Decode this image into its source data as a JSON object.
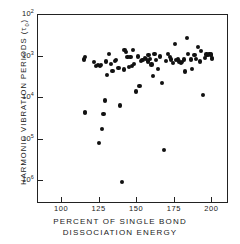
{
  "chart_data": {
    "type": "scatter",
    "title": "",
    "xlabel": "PERCENT OF SINGLE BOND DISSOCIATION ENERGY",
    "xlabel_line1": "PERCENT OF SINGLE BOND",
    "xlabel_line2": "DISSOCIATION ENERGY",
    "ylabel": "HARMONIC VIBRATION PERIODS (τ₀)",
    "ylabel_text": "HARMONIC VIBRATION PERIODS (",
    "ylabel_symbol": "τ",
    "ylabel_subscript": "0",
    "ylabel_close": ")",
    "xlim": [
      84,
      211
    ],
    "ylim_log_exponents": [
      2,
      6.55
    ],
    "yscale": "log-inverted",
    "y_axis_direction": "decreasing-downward",
    "grid": false,
    "legend": null,
    "marker": "filled-circle",
    "marker_color": "#111111",
    "frame_color": "#222222",
    "background": "#ffffff",
    "xticks": [
      {
        "value": 100,
        "label": "100"
      },
      {
        "value": 125,
        "label": "125"
      },
      {
        "value": 150,
        "label": "150"
      },
      {
        "value": 175,
        "label": "175"
      },
      {
        "value": 200,
        "label": "200"
      }
    ],
    "yticks": [
      {
        "exponent": 2,
        "mantissa": "10",
        "label": "10²"
      },
      {
        "exponent": 3,
        "mantissa": "10",
        "label": "10³"
      },
      {
        "exponent": 4,
        "mantissa": "10",
        "label": "10⁴"
      },
      {
        "exponent": 5,
        "mantissa": "10",
        "label": "10⁵"
      },
      {
        "exponent": 6,
        "mantissa": "10",
        "label": "10⁶"
      }
    ],
    "x": [
      114.5,
      115.5,
      115.0,
      115.2,
      121.5,
      122.5,
      124.0,
      125.0,
      126.0,
      124.5,
      126.5,
      127.5,
      128.5,
      129.0,
      130.0,
      131.0,
      132.5,
      133.5,
      135.0,
      136.0,
      137.5,
      138.5,
      140.0,
      141.0,
      141.5,
      142.5,
      143.5,
      144.5,
      145.5,
      146.5,
      147.0,
      148.0,
      149.0,
      150.5,
      151.5,
      152.5,
      153.5,
      155.0,
      156.0,
      157.0,
      157.5,
      158.5,
      159.5,
      160.5,
      161.5,
      162.5,
      164.0,
      165.0,
      166.5,
      168.0,
      169.0,
      170.5,
      171.5,
      172.5,
      173.5,
      175.0,
      176.0,
      177.0,
      178.0,
      179.0,
      180.0,
      181.0,
      182.0,
      183.0,
      184.0,
      185.5,
      186.5,
      188.0,
      189.0,
      190.5,
      191.5,
      192.5,
      193.5,
      195.0,
      196.0,
      197.0,
      198.0,
      198.8,
      199.2,
      199.5,
      199.8
    ],
    "y_exponents": [
      3.07,
      3.02,
      4.33,
      4.36,
      3.13,
      3.22,
      3.21,
      3.23,
      3.2,
      5.08,
      4.74,
      4.38,
      4.06,
      3.12,
      3.44,
      2.93,
      3.17,
      3.35,
      3.1,
      3.09,
      3.28,
      4.18,
      6.02,
      3.31,
      2.84,
      2.9,
      3.02,
      3.25,
      3.02,
      3.23,
      2.85,
      3.18,
      3.84,
      3.0,
      3.71,
      3.1,
      3.09,
      3.03,
      3.06,
      3.12,
      2.97,
      3.05,
      3.19,
      3.46,
      2.93,
      3.08,
      3.3,
      3.0,
      3.63,
      5.25,
      3.11,
      2.93,
      3.02,
      3.07,
      3.15,
      2.7,
      3.09,
      3.06,
      3.12,
      3.15,
      3.13,
      3.07,
      3.36,
      2.55,
      2.94,
      3.07,
      3.3,
      2.96,
      3.05,
      2.78,
      3.12,
      2.87,
      3.93,
      3.04,
      2.95,
      2.97,
      2.94,
      2.95,
      2.96,
      3.04,
      3.06
    ]
  }
}
